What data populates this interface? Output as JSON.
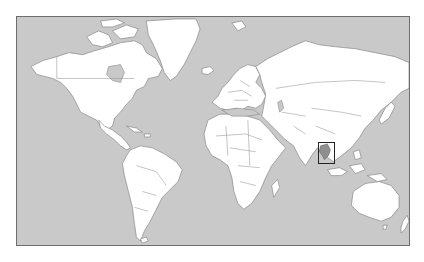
{
  "map": {
    "type": "world-locator-map",
    "projection": "mercator",
    "colors": {
      "ocean": "#c9c9c9",
      "land": "#ffffff",
      "borders": "#7a7a7a",
      "highlight_fill": "#8f8f8f",
      "highlight_box": "#222222",
      "frame": "#6e6e6e"
    },
    "highlighted_region": {
      "name": "Thailand",
      "box": {
        "x": 317,
        "y": 141,
        "width": 17,
        "height": 22
      }
    },
    "frame": {
      "x": 16,
      "y": 16,
      "width": 394,
      "height": 230
    }
  }
}
